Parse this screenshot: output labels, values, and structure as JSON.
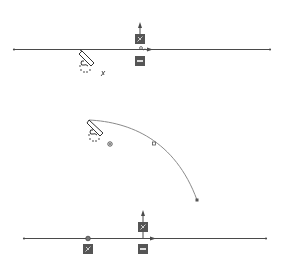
{
  "diagram": {
    "type": "cad-sketch-constraints",
    "colors": {
      "line": "#4a4a4a",
      "arc": "#8a8a8a",
      "glyph_fill": "#555555",
      "glyph_light": "#dddddd",
      "background": "#ffffff"
    },
    "panels": [
      {
        "name": "top-panel",
        "description": "Horizontal line with pencil cursor, horizontal constraint glyph and relation icons",
        "icons": [
          "arrow-up-icon",
          "constraint-badge-icon",
          "horizontal-constraint-icon",
          "pencil-cursor-icon",
          "coincident-icon"
        ]
      },
      {
        "name": "middle-panel",
        "description": "Tangent arc with pencil cursor, midpoint and endpoint markers",
        "icons": [
          "pencil-cursor-icon",
          "point-marker-icon",
          "midpoint-marker-icon",
          "endpoint-marker-icon"
        ]
      },
      {
        "name": "bottom-panel",
        "description": "Horizontal line with point, constraint badges and direction arrow",
        "icons": [
          "arrow-up-icon",
          "constraint-badge-icon",
          "horizontal-constraint-icon",
          "point-marker-icon",
          "arrow-right-icon"
        ]
      }
    ]
  }
}
